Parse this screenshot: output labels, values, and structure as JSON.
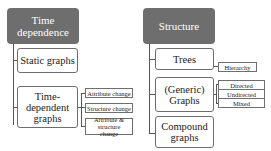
{
  "groups": [
    {
      "title": "Time dependence",
      "children": [
        {
          "label": "Static graphs",
          "leaves": []
        },
        {
          "label": "Time-dependent graphs",
          "leaves": [
            "Attribute change",
            "Structure change",
            "Attribute & structure change"
          ]
        }
      ]
    },
    {
      "title": "Structure",
      "children": [
        {
          "label": "Trees",
          "leaves": [
            "Hierarchy"
          ]
        },
        {
          "label": "(Generic) Graphs",
          "leaves": [
            "Directed",
            "Undirected",
            "Mixed"
          ]
        },
        {
          "label": "Compound graphs",
          "leaves": []
        }
      ]
    }
  ],
  "colors": {
    "header_bg": "#6e6e6e",
    "header_text": "#ffffff",
    "border": "#6e6e6e"
  }
}
